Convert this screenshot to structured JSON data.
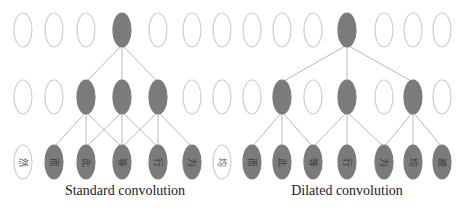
{
  "colors": {
    "filled": "#7b7b7b",
    "empty_stroke": "#cfcfcf",
    "line": "#b8b8b8",
    "char_on_filled": "#3a3a3a",
    "char_on_empty": "#555555"
  },
  "ellipse": {
    "rx": 9,
    "ry": 17
  },
  "rows_y": {
    "top": 30,
    "middle": 97,
    "bottom": 162
  },
  "diagrams": [
    {
      "name": "standard",
      "caption": "Standard convolution",
      "caption_x": 125,
      "columns_x": [
        23,
        54,
        86,
        122,
        158,
        192,
        222
      ],
      "top_filled": [
        3
      ],
      "middle_filled": [
        2,
        3,
        4
      ],
      "bottom_filled": [
        1,
        2,
        3,
        4,
        5
      ],
      "bottom_chars": [
        "然",
        "而",
        "此",
        "等",
        "行",
        "为",
        "均"
      ],
      "edges_top_to_middle": [
        [
          3,
          2
        ],
        [
          3,
          3
        ],
        [
          3,
          4
        ]
      ],
      "edges_middle_to_bottom": [
        [
          2,
          1
        ],
        [
          2,
          2
        ],
        [
          2,
          3
        ],
        [
          3,
          2
        ],
        [
          3,
          3
        ],
        [
          3,
          4
        ],
        [
          4,
          3
        ],
        [
          4,
          4
        ],
        [
          4,
          5
        ]
      ]
    },
    {
      "name": "dilated",
      "caption": "Dilated convolution",
      "caption_x": 347,
      "columns_x": [
        252,
        282,
        313,
        347,
        384,
        413,
        442
      ],
      "top_filled": [
        3
      ],
      "middle_filled": [
        1,
        3,
        5
      ],
      "bottom_filled": [
        0,
        1,
        2,
        3,
        4,
        5,
        6
      ],
      "bottom_chars": [
        "而",
        "此",
        "等",
        "行",
        "为",
        "均",
        "被"
      ],
      "edges_top_to_middle": [
        [
          3,
          1
        ],
        [
          3,
          3
        ],
        [
          3,
          5
        ]
      ],
      "edges_middle_to_bottom": [
        [
          1,
          0
        ],
        [
          1,
          1
        ],
        [
          1,
          2
        ],
        [
          3,
          2
        ],
        [
          3,
          3
        ],
        [
          3,
          4
        ],
        [
          5,
          4
        ],
        [
          5,
          5
        ],
        [
          5,
          6
        ]
      ]
    }
  ],
  "extra_bottom_left": {
    "x": 222,
    "char": "均"
  }
}
